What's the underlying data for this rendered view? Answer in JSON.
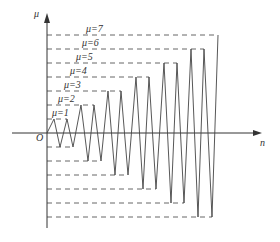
{
  "diagram": {
    "y_axis_label": "μ",
    "x_axis_label": "n",
    "origin_label": "O",
    "level_labels": [
      "μ=1",
      "μ=2",
      "μ=3",
      "μ=4",
      "μ=5",
      "μ=6",
      "μ=7"
    ],
    "colors": {
      "line": "#444444",
      "dash": "#555555",
      "axis": "#333333"
    }
  }
}
